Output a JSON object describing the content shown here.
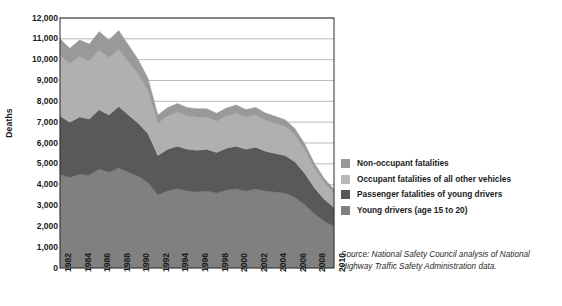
{
  "chart_data": {
    "type": "area",
    "stacked": true,
    "title": "",
    "xlabel": "",
    "ylabel": "Deaths",
    "ylim": [
      0,
      12000
    ],
    "ytick_step": 1000,
    "grid": true,
    "legend_position": "right",
    "x": [
      1982,
      1983,
      1984,
      1985,
      1986,
      1987,
      1988,
      1989,
      1990,
      1991,
      1992,
      1993,
      1994,
      1995,
      1996,
      1997,
      1998,
      1999,
      2000,
      2001,
      2002,
      2003,
      2004,
      2005,
      2006,
      2007,
      2008,
      2009,
      2010
    ],
    "xtick_labels": [
      "1982",
      "1984",
      "1986",
      "1988",
      "1990",
      "1992",
      "1994",
      "1996",
      "1998",
      "2000",
      "2002",
      "2004",
      "2006",
      "2008",
      "2010"
    ],
    "ytick_labels": [
      "12,000",
      "11,000",
      "10,000",
      "9,000",
      "8,000",
      "7,000",
      "6,000",
      "5,000",
      "4,000",
      "3,000",
      "2,000",
      "1,000",
      "0"
    ],
    "series": [
      {
        "name": "Young drivers (age 15 to 20)",
        "color": "#808080",
        "values": [
          4500,
          4350,
          4500,
          4450,
          4750,
          4600,
          4800,
          4600,
          4400,
          4100,
          3500,
          3700,
          3800,
          3700,
          3650,
          3700,
          3600,
          3750,
          3800,
          3700,
          3800,
          3700,
          3650,
          3600,
          3400,
          3050,
          2600,
          2250,
          2000
        ]
      },
      {
        "name": "Passenger fatalities of young drivers",
        "color": "#595959",
        "values": [
          2800,
          2650,
          2750,
          2700,
          2850,
          2750,
          2950,
          2750,
          2550,
          2350,
          1900,
          2000,
          2050,
          2000,
          2000,
          2000,
          1950,
          2000,
          2050,
          2000,
          2000,
          1900,
          1850,
          1800,
          1700,
          1500,
          1250,
          1050,
          900
        ]
      },
      {
        "name": "Occupant fatalities of all other vehicles",
        "color": "#b0b0b0",
        "values": [
          2900,
          2800,
          2900,
          2800,
          2850,
          2750,
          2750,
          2550,
          2350,
          2050,
          1550,
          1600,
          1650,
          1600,
          1600,
          1550,
          1500,
          1550,
          1600,
          1550,
          1550,
          1500,
          1450,
          1400,
          1300,
          1150,
          950,
          800,
          700
        ]
      },
      {
        "name": "Non-occupant fatalities",
        "color": "#999999",
        "values": [
          800,
          750,
          800,
          800,
          900,
          850,
          900,
          800,
          700,
          600,
          400,
          400,
          400,
          400,
          400,
          400,
          380,
          380,
          380,
          360,
          360,
          340,
          330,
          320,
          300,
          270,
          230,
          200,
          180
        ]
      }
    ]
  },
  "legend": {
    "items": [
      {
        "label": "Non-occupant fatalities",
        "color": "#999999"
      },
      {
        "label": "Occupant fatalities of all other vehicles",
        "color": "#b8b8b8"
      },
      {
        "label": "Passenger fatalities of young drivers",
        "color": "#585858"
      },
      {
        "label": "Young drivers (age 15 to 20)",
        "color": "#808080"
      }
    ]
  },
  "source": {
    "text": "Source: National Safety Council analysis of National Highway Traffic Safety Administration data."
  }
}
